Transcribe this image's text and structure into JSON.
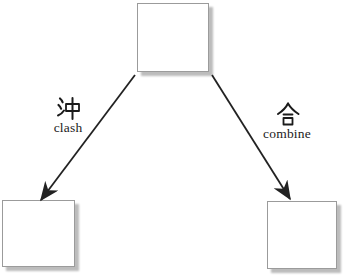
{
  "figure": {
    "nodes": [
      {
        "id": "top-box",
        "label": ""
      },
      {
        "id": "bottom-left-box",
        "label": ""
      },
      {
        "id": "bottom-right-box",
        "label": ""
      }
    ],
    "edges": [
      {
        "from": "top-box",
        "to": "bottom-left-box",
        "hanzi": "沖",
        "english": "clash"
      },
      {
        "from": "top-box",
        "to": "bottom-right-box",
        "hanzi": "合",
        "english": "combine"
      }
    ],
    "colors": {
      "background": "#ffffff",
      "box_fill": "#ffffff",
      "box_border": "#9b9b9b",
      "box_shadow": "#bcbcbc",
      "arrow": "#222222",
      "text": "#1b1b1b"
    }
  }
}
